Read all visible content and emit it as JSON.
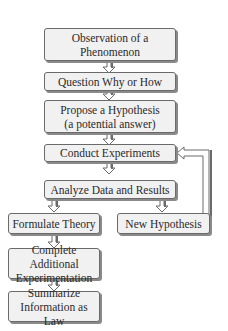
{
  "diagram": {
    "type": "flowchart",
    "nodes": [
      {
        "id": "observation",
        "label": "Observation of a Phenomenon",
        "lines": [
          "Observation of a",
          "Phenomenon"
        ]
      },
      {
        "id": "question",
        "label": "Question Why or How",
        "lines": [
          "Question Why or How"
        ]
      },
      {
        "id": "hypothesis",
        "label": "Propose a Hypothesis (a potential answer)",
        "lines": [
          "Propose a Hypothesis",
          "(a potential answer)"
        ]
      },
      {
        "id": "experiments",
        "label": "Conduct Experiments",
        "lines": [
          "Conduct Experiments"
        ]
      },
      {
        "id": "analyze",
        "label": "Analyze Data and Results",
        "lines": [
          "Analyze Data and Results"
        ]
      },
      {
        "id": "theory",
        "label": "Formulate Theory",
        "lines": [
          "Formulate Theory"
        ]
      },
      {
        "id": "new_hypothesis",
        "label": "New Hypothesis",
        "lines": [
          "New Hypothesis"
        ]
      },
      {
        "id": "additional",
        "label": "Complete Additional Experimentation",
        "lines": [
          "Complete Additional",
          "Experimentation"
        ]
      },
      {
        "id": "law",
        "label": "Summarize Information as Law",
        "lines": [
          "Summarize",
          "Information as Law"
        ]
      }
    ],
    "edges": [
      {
        "from": "observation",
        "to": "question"
      },
      {
        "from": "question",
        "to": "hypothesis"
      },
      {
        "from": "hypothesis",
        "to": "experiments"
      },
      {
        "from": "experiments",
        "to": "analyze"
      },
      {
        "from": "analyze",
        "to": "theory"
      },
      {
        "from": "analyze",
        "to": "new_hypothesis"
      },
      {
        "from": "new_hypothesis",
        "to": "experiments",
        "style": "feedback-loop"
      },
      {
        "from": "theory",
        "to": "additional"
      },
      {
        "from": "additional",
        "to": "law"
      }
    ],
    "colors": {
      "box_fill": "#f1f1f1",
      "box_border": "#6a6a6a",
      "shadow": "#8a8a8a",
      "text": "#2a2a2a"
    }
  }
}
